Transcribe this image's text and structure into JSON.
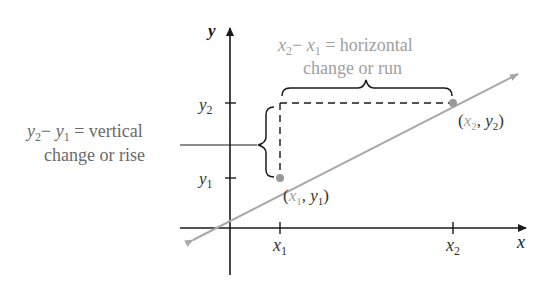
{
  "diagram": {
    "type": "slope-illustration",
    "colors": {
      "axis": "#1a1a1a",
      "line": "#a8a8a8",
      "point": "#999999",
      "label_dark": "#333333",
      "label_gray": "#a0a0a0",
      "label_mid": "#6a6a6a"
    },
    "axes": {
      "x_label": "x",
      "y_label": "y",
      "x_ticks": [
        {
          "base": "x",
          "sub": "1"
        },
        {
          "base": "x",
          "sub": "2"
        }
      ],
      "y_ticks": [
        {
          "base": "y",
          "sub": "2"
        },
        {
          "base": "y",
          "sub": "1"
        }
      ]
    },
    "points": [
      {
        "label_x": "x",
        "sub_x": "1",
        "label_y": "y",
        "sub_y": "1",
        "text": "(x1, y1)"
      },
      {
        "label_x": "x",
        "sub_x": "2",
        "label_y": "y",
        "sub_y": "2",
        "text": "(x2, y2)"
      }
    ],
    "annotations": {
      "horizontal": {
        "expr_a": "x",
        "expr_a_sub": "2",
        "minus": "−",
        "expr_b": "x",
        "expr_b_sub": "1",
        "equals": "= horizontal",
        "line2": "change or run"
      },
      "vertical": {
        "expr_a": "y",
        "expr_a_sub": "2",
        "minus": "−",
        "expr_b": "y",
        "expr_b_sub": "1",
        "equals": "= vertical",
        "line2": "change or rise"
      }
    }
  }
}
